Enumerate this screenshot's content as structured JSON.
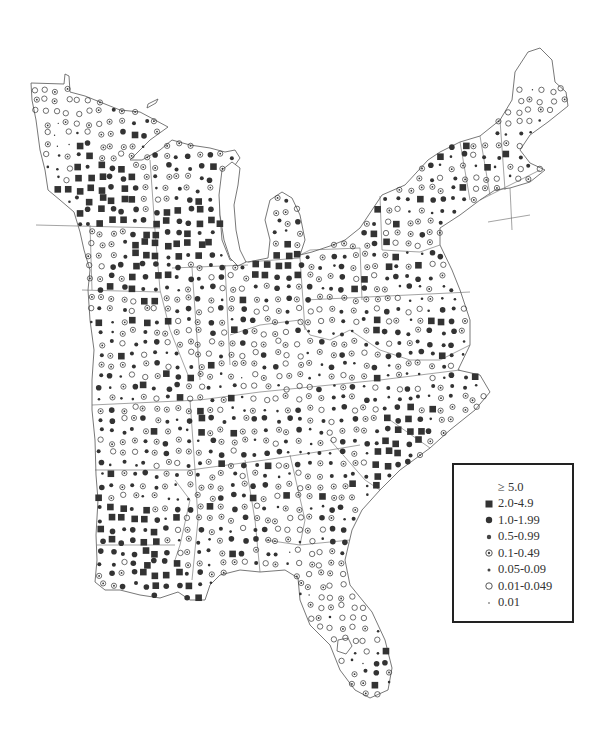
{
  "map": {
    "title": "",
    "region": "Eastern United States",
    "symbol_color": "#333333",
    "outline_color": "#555555"
  },
  "legend": {
    "items": [
      {
        "label": "≥ 5.0",
        "symbol": "none"
      },
      {
        "label": "2.0-4.9",
        "symbol": "filled-square"
      },
      {
        "label": "1.0-1.99",
        "symbol": "large-filled-dot"
      },
      {
        "label": "0.5-0.99",
        "symbol": "medium-filled-dot"
      },
      {
        "label": "0.1-0.49",
        "symbol": "dotted-circle"
      },
      {
        "label": "0.05-0.09",
        "symbol": "small-filled-dot"
      },
      {
        "label": "0.01-0.049",
        "symbol": "open-circle"
      },
      {
        "label": "0.01",
        "symbol": "tiny-dot"
      }
    ]
  },
  "chart_data": {
    "type": "scatter",
    "title": "",
    "subtitle": "",
    "xlabel": "",
    "ylabel": "",
    "legend_position": "bottom-right",
    "classes": [
      "≥ 5.0",
      "2.0-4.9",
      "1.0-1.99",
      "0.5-0.99",
      "0.1-0.49",
      "0.05-0.09",
      "0.01-0.049",
      "0.01"
    ],
    "regional_dominant_class": [
      {
        "region": "Minnesota (NW)",
        "class": "0.01-0.049"
      },
      {
        "region": "Minnesota (SE) / Wisconsin (W)",
        "class": "2.0-4.9"
      },
      {
        "region": "Iowa",
        "class": "0.1-0.49"
      },
      {
        "region": "Illinois (N)",
        "class": "2.0-4.9"
      },
      {
        "region": "Michigan (N)",
        "class": "0.1-0.49"
      },
      {
        "region": "Michigan (S)",
        "class": "1.0-1.99"
      },
      {
        "region": "Ohio / Indiana",
        "class": "0.1-0.49"
      },
      {
        "region": "Kentucky (E) / West Virginia",
        "class": "0.01-0.049"
      },
      {
        "region": "Maine",
        "class": "0.01-0.049"
      },
      {
        "region": "New York / Pennsylvania",
        "class": "0.1-0.49"
      },
      {
        "region": "Virginia (E)",
        "class": "2.0-4.9"
      },
      {
        "region": "North Carolina (E)",
        "class": "2.0-4.9"
      },
      {
        "region": "Georgia (central)",
        "class": "1.0-1.99"
      },
      {
        "region": "Mississippi Valley",
        "class": "2.0-4.9"
      },
      {
        "region": "Louisiana",
        "class": "2.0-4.9"
      },
      {
        "region": "Alabama",
        "class": "0.1-0.49"
      },
      {
        "region": "Florida",
        "class": "0.1-0.49"
      }
    ]
  }
}
